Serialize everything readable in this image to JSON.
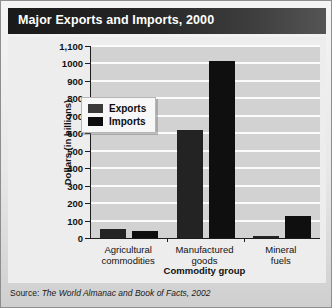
{
  "title": "Major Exports and Imports, 2000",
  "source": {
    "label": "Source:",
    "text": "The World Almanac and Book of Facts, 2002"
  },
  "legend": {
    "position": "inside-top-left",
    "entries": [
      {
        "name": "Exports",
        "color": "#3a3a3a"
      },
      {
        "name": "Imports",
        "color": "#0d0d0d"
      }
    ]
  },
  "chart_data": {
    "type": "bar",
    "title": "Major Exports and Imports, 2000",
    "xlabel": "Commodity group",
    "ylabel": "Dollars (in billions)",
    "categories": [
      "Agricultural\ncommodities",
      "Manufactured\ngoods",
      "Mineral\nfuels"
    ],
    "series": [
      {
        "name": "Exports",
        "values": [
          50,
          620,
          12
        ],
        "color": "#232323"
      },
      {
        "name": "Imports",
        "values": [
          40,
          1015,
          125
        ],
        "color": "#0f0f0f"
      }
    ],
    "ylim": [
      0,
      1100
    ],
    "ytick_step": 100,
    "ytick_labels": [
      "1,100",
      "1000",
      "900",
      "800",
      "700",
      "600",
      "500",
      "400",
      "300",
      "200",
      "100",
      "0"
    ],
    "grid": true,
    "legend_position": "inside-top-left"
  }
}
